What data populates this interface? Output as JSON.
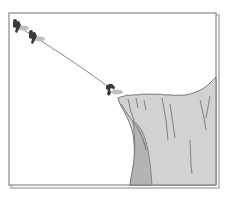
{
  "figure": {
    "caption_fragment": "",
    "colors": {
      "frame": "#8a8a8a",
      "frame_shadow": "#c4c4c4",
      "background": "#ffffff",
      "cliff_fill": "#d2d2d2",
      "cliff_shadow": "#b4b4b4",
      "cliff_stroke": "#5a5a5a",
      "rope": "#7a7a7a",
      "climber": "#3a3a3a",
      "climber_shadow": "#c0c0c0"
    },
    "climbers": [
      {
        "label": "climber-1",
        "x": 16,
        "y": 26
      },
      {
        "label": "climber-2",
        "x": 32,
        "y": 37
      },
      {
        "label": "climber-3",
        "x": 110,
        "y": 89
      }
    ]
  }
}
